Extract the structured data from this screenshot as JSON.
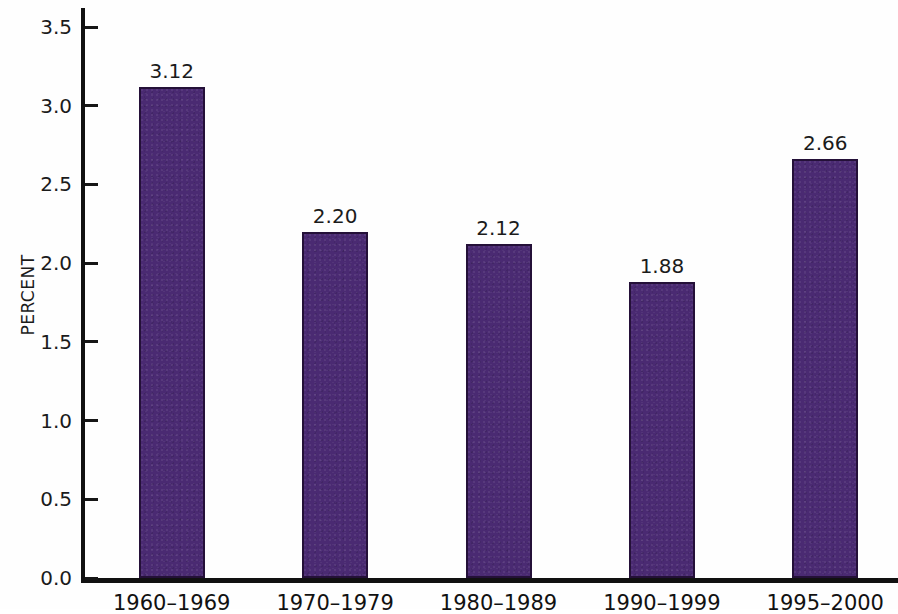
{
  "chart_data": {
    "type": "bar",
    "title": "",
    "subtitle": "",
    "xlabel": "",
    "ylabel": "PERCENT",
    "categories": [
      "1960–1969",
      "1970–1979",
      "1980–1989",
      "1990–1999",
      "1995–2000"
    ],
    "values": [
      3.12,
      2.2,
      2.12,
      1.88,
      2.66
    ],
    "value_labels": [
      "3.12",
      "2.20",
      "2.12",
      "1.88",
      "2.66"
    ],
    "ylim": [
      0.0,
      3.5
    ],
    "ytick_values": [
      0.0,
      0.5,
      1.0,
      1.5,
      2.0,
      2.5,
      3.0,
      3.5
    ],
    "ytick_labels": [
      "0.0",
      "0.5",
      "1.0",
      "1.5",
      "2.0",
      "2.5",
      "3.0",
      "3.5"
    ],
    "grid": false,
    "legend": false,
    "legend_position": "none",
    "bar_color": "#4a2a72",
    "bar_edge_color": "#241038",
    "axis_color": "#111111",
    "text_color": "#1b1b1b",
    "background_color": "#ffffff"
  }
}
